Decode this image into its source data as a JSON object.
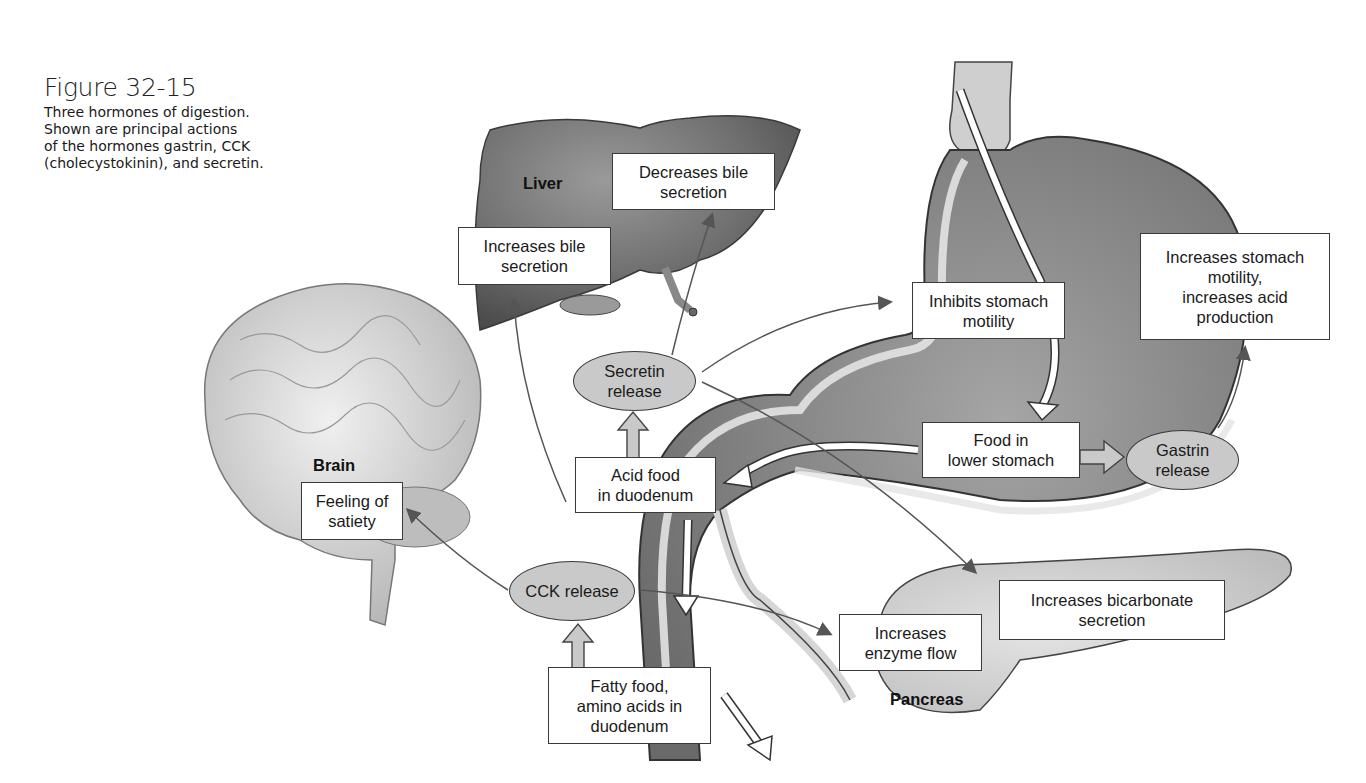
{
  "figure": {
    "title": "Figure 32-15",
    "caption_lines": [
      "Three hormones of digestion.",
      "Shown are principal actions",
      "of the hormones gastrin, CCK",
      "(cholecystokinin), and secretin."
    ]
  },
  "organs": {
    "liver": "Liver",
    "brain": "Brain",
    "pancreas": "Pancreas"
  },
  "hormones": {
    "secretin": [
      "Secretin",
      "release"
    ],
    "cck": [
      "CCK release"
    ],
    "gastrin": [
      "Gastrin",
      "release"
    ]
  },
  "stimuli": {
    "acid_food": [
      "Acid food",
      "in duodenum"
    ],
    "fatty_food": [
      "Fatty food,",
      "amino acids in",
      "duodenum"
    ],
    "food_lower_stomach": [
      "Food in",
      "lower stomach"
    ]
  },
  "effects": {
    "decreases_bile": [
      "Decreases bile",
      "secretion"
    ],
    "increases_bile": [
      "Increases bile",
      "secretion"
    ],
    "inhibits_stomach": [
      "Inhibits stomach",
      "motility"
    ],
    "increases_stomach": [
      "Increases stomach",
      "motility,",
      "increases acid",
      "production"
    ],
    "feeling_satiety": [
      "Feeling of",
      "satiety"
    ],
    "increases_enzyme": [
      "Increases",
      "enzyme flow"
    ],
    "increases_bicarbonate": [
      "Increases bicarbonate",
      "secretion"
    ]
  },
  "colors": {
    "organ_dark": "#6e6e6e",
    "organ_light": "#d8d8d8",
    "hormone_fill": "#c9c9c9",
    "arrow": "#555555",
    "box_border": "#3a3a3a"
  }
}
